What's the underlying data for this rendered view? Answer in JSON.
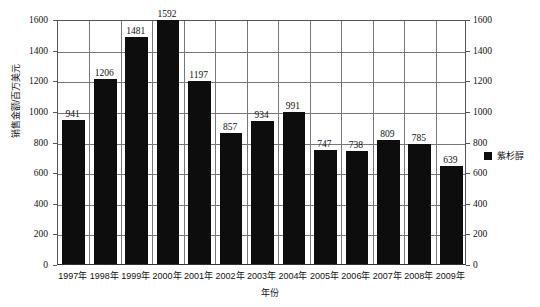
{
  "chart_data": {
    "type": "bar",
    "title": "",
    "categories": [
      "1997年",
      "1998年",
      "1999年",
      "2000年",
      "2001年",
      "2002年",
      "2003年",
      "2004年",
      "2005年",
      "2006年",
      "2007年",
      "2008年",
      "2009年"
    ],
    "values": [
      941,
      1206,
      1481,
      1592,
      1197,
      857,
      934,
      991,
      747,
      738,
      809,
      785,
      639
    ],
    "series": [
      {
        "name": "紫杉醇",
        "values": [
          941,
          1206,
          1481,
          1592,
          1197,
          857,
          934,
          991,
          747,
          738,
          809,
          785,
          639
        ],
        "color": "#0d0d0d"
      }
    ],
    "xlabel": "年份",
    "ylabel": "销售金额/百万美元",
    "ylim": [
      0,
      1600
    ],
    "ytick_step": 200,
    "yticks": [
      "0",
      "200",
      "400",
      "600",
      "800",
      "1000",
      "1200",
      "1400",
      "1600"
    ],
    "yticks_right": [
      "0",
      "200",
      "400",
      "600",
      "800",
      "1000",
      "1200",
      "1400",
      "1600"
    ],
    "grid": true,
    "grid_horizontal": true,
    "grid_vertical": true,
    "legend_position": "right",
    "data_labels": [
      "941",
      "1206",
      "1481",
      "1592",
      "1197",
      "857",
      "934",
      "991",
      "747",
      "738",
      "809",
      "785",
      "639"
    ],
    "dual_y_axis": true
  },
  "legend": {
    "entries": [
      {
        "label": "紫杉醇",
        "color": "#0d0d0d"
      }
    ]
  },
  "axes": {
    "y_title": "销售金额/百万美元",
    "x_title": "年份"
  }
}
